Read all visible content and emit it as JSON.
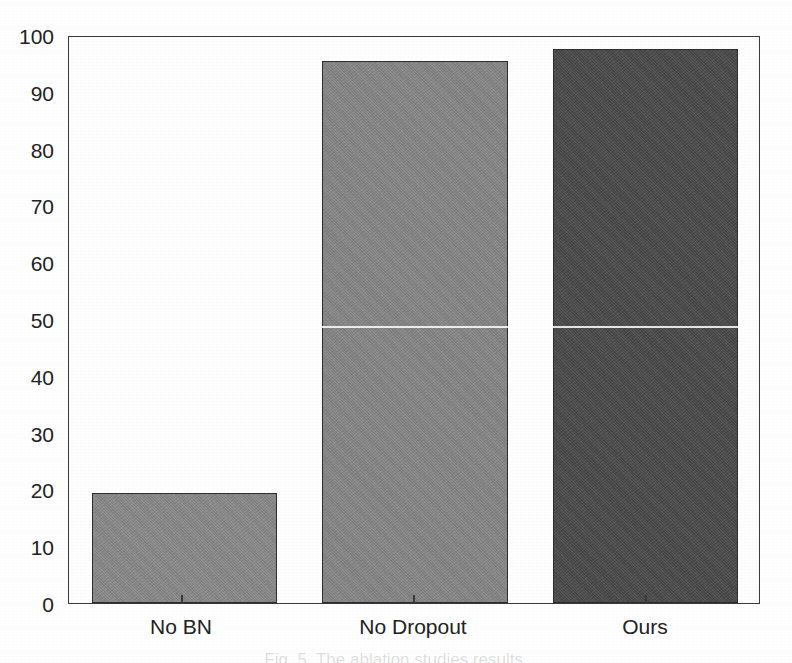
{
  "chart_data": {
    "type": "bar",
    "title": "",
    "subtitle": "",
    "xlabel": "",
    "ylabel": "",
    "categories": [
      "No BN",
      "No Dropout",
      "Ours"
    ],
    "values": [
      19.4,
      95.5,
      97.5
    ],
    "series": [
      {
        "name": "Accuracy",
        "values": [
          19.4,
          95.5,
          97.5
        ]
      }
    ],
    "ylim": [
      0,
      100
    ],
    "y_ticks": [
      0,
      10,
      20,
      30,
      40,
      50,
      60,
      70,
      80,
      90,
      100
    ],
    "y_tick_labels": [
      "0",
      "10",
      "20",
      "30",
      "40",
      "50",
      "60",
      "70",
      "80",
      "90",
      "100"
    ],
    "grid": false,
    "legend": false,
    "legend_position": "none",
    "bar_colors": [
      "#8a8a8a",
      "#878787",
      "#4a4a4a"
    ],
    "bar_edge_color": "#2e2e2e",
    "axis_color": "#3a3a3a",
    "background_color": "#ffffff",
    "annotations": []
  },
  "axes": {
    "y_tick_labels": [
      "100",
      "90",
      "80",
      "70",
      "60",
      "50",
      "40",
      "30",
      "20",
      "10",
      "0"
    ],
    "x_tick_labels": [
      "No BN",
      "No Dropout",
      "Ours"
    ]
  },
  "caption": {
    "text": "Fig. 5.  The ablation studies results."
  }
}
